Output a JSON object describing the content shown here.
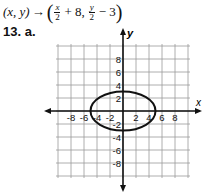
{
  "formula": {
    "lhs": "(x, y)",
    "arrow": "→",
    "open": "(",
    "term1_num": "x",
    "term1_den": "2",
    "term1_rest": "+ 8,",
    "term2_num": "y",
    "term2_den": "2",
    "term2_rest": "− 3",
    "close": ")"
  },
  "problem_label": "13. a.",
  "chart_data": {
    "type": "line",
    "title": "",
    "xlabel": "x",
    "ylabel": "y",
    "xlim": [
      -10,
      10
    ],
    "ylim": [
      -10,
      10
    ],
    "grid": true,
    "grid_step": 2,
    "x_ticks": [
      "-8",
      "-6",
      "-4",
      "-2",
      "2",
      "4",
      "6",
      "8"
    ],
    "y_ticks": [
      "8",
      "6",
      "4",
      "2",
      "-2",
      "-4",
      "-6",
      "-8"
    ],
    "series": [
      {
        "name": "ellipse",
        "shape": "ellipse",
        "center": [
          0,
          0
        ],
        "radius_x": 5,
        "radius_y": 3,
        "points": [
          [
            5,
            0
          ],
          [
            0,
            3
          ],
          [
            -5,
            0
          ],
          [
            0,
            -3
          ]
        ]
      }
    ]
  }
}
